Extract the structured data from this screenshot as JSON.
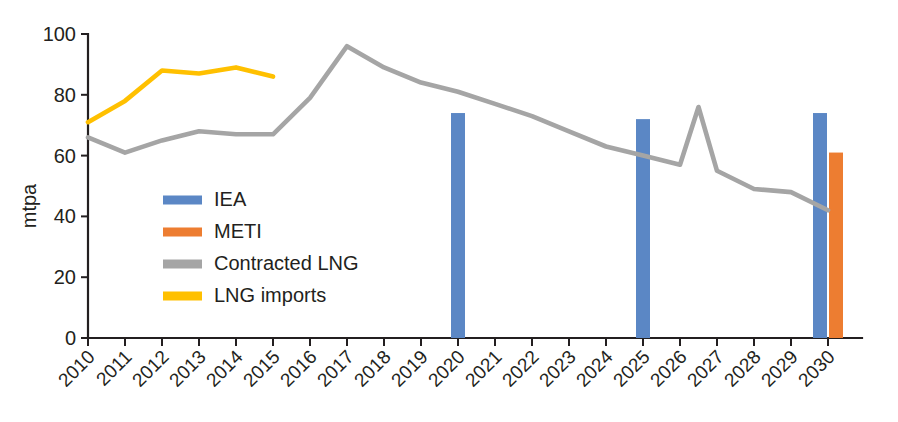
{
  "chart_data": {
    "type": "bar",
    "title": "",
    "xlabel": "",
    "ylabel": "mtpa",
    "ylim": [
      0,
      100
    ],
    "yticks": [
      0,
      20,
      40,
      60,
      80,
      100
    ],
    "grid": false,
    "legend_position": "inside-left",
    "categories": [
      "2010",
      "2011",
      "2012",
      "2013",
      "2014",
      "2015",
      "2016",
      "2017",
      "2018",
      "2019",
      "2020",
      "2021",
      "2022",
      "2023",
      "2024",
      "2025",
      "2026",
      "2027",
      "2028",
      "2029",
      "2030"
    ],
    "series": [
      {
        "name": "IEA",
        "type": "bar",
        "color": "#5B87C5",
        "values": [
          null,
          null,
          null,
          null,
          null,
          null,
          null,
          null,
          null,
          null,
          74,
          null,
          null,
          null,
          null,
          72,
          null,
          null,
          null,
          null,
          74
        ]
      },
      {
        "name": "METI",
        "type": "bar",
        "color": "#ED7D31",
        "values": [
          null,
          null,
          null,
          null,
          null,
          null,
          null,
          null,
          null,
          null,
          null,
          null,
          null,
          null,
          null,
          null,
          null,
          null,
          null,
          null,
          61
        ]
      },
      {
        "name": "Contracted LNG",
        "type": "line",
        "color": "#A5A5A5",
        "values": [
          66,
          61,
          65,
          68,
          67,
          67,
          79,
          96,
          89,
          84,
          81,
          77,
          73,
          68,
          63,
          60,
          57,
          55,
          49,
          48,
          42
        ]
      },
      {
        "name": "LNG imports",
        "type": "line",
        "color": "#FFC000",
        "values": [
          71,
          78,
          88,
          87,
          89,
          86,
          null,
          null,
          null,
          null,
          null,
          null,
          null,
          null,
          null,
          null,
          null,
          null,
          null,
          null,
          null
        ]
      }
    ],
    "contracted_lng_extra_points": [
      {
        "x": 16.5,
        "y": 76
      }
    ],
    "legend": [
      {
        "label": "IEA",
        "color": "#5B87C5"
      },
      {
        "label": "METI",
        "color": "#ED7D31"
      },
      {
        "label": "Contracted LNG",
        "color": "#A5A5A5"
      },
      {
        "label": "LNG imports",
        "color": "#FFC000"
      }
    ]
  }
}
